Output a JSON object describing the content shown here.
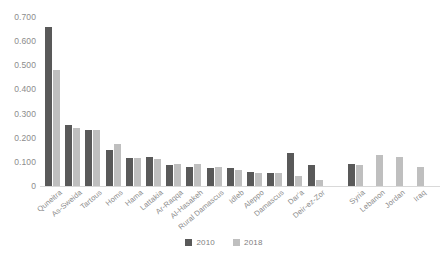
{
  "chart_data": {
    "type": "bar",
    "title": "",
    "subtitle": "",
    "xlabel": "",
    "ylabel": "",
    "ylim": [
      0,
      0.7
    ],
    "ytick_labels": [
      "0.700",
      "0.600",
      "0.500",
      "0.400",
      "0.300",
      "0.200",
      "0.100",
      "0"
    ],
    "ytick_values": [
      0.7,
      0.6,
      0.5,
      0.4,
      0.3,
      0.2,
      0.1,
      0
    ],
    "grid": false,
    "legend_position": "bottom",
    "categories": [
      "Quneitra",
      "As-Sweida",
      "Tartous",
      "Homs",
      "Hama",
      "Lattakia",
      "Ar-Raqqa",
      "Al-Hasakeh",
      "Rural Damascus",
      "Idleb",
      "Aleppo",
      "Damascus",
      "Dar'a",
      "Deir-ez-Zor",
      "",
      "Syria",
      "Lebanon",
      "Jordan",
      "Iraq"
    ],
    "series": [
      {
        "name": "2010",
        "color": "#595959",
        "values": [
          0.66,
          0.253,
          0.23,
          0.15,
          0.118,
          0.12,
          0.085,
          0.078,
          0.075,
          0.073,
          0.06,
          0.055,
          0.135,
          0.088,
          null,
          0.09,
          null,
          null,
          null
        ]
      },
      {
        "name": "2018",
        "color": "#bfbfbf",
        "values": [
          0.48,
          0.241,
          0.232,
          0.175,
          0.115,
          0.11,
          0.09,
          0.09,
          0.08,
          0.068,
          0.052,
          0.052,
          0.04,
          0.025,
          null,
          0.085,
          0.13,
          0.12,
          0.08
        ]
      }
    ]
  },
  "legend": {
    "items": [
      {
        "label": "2010",
        "color": "#595959"
      },
      {
        "label": "2018",
        "color": "#bfbfbf"
      }
    ]
  },
  "colors": {
    "series_2010": "#595959",
    "series_2018": "#bfbfbf",
    "axis": "#d9d9d9",
    "text": "#8c8c8c",
    "background": "#ffffff"
  }
}
